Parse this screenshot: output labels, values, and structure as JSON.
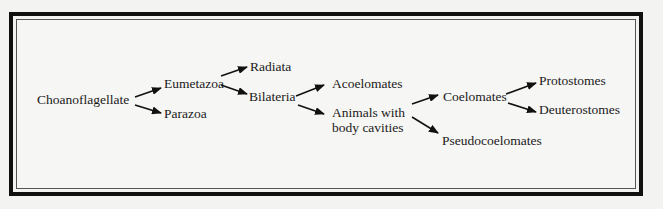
{
  "diagram": {
    "type": "phylogeny-flow",
    "nodes": {
      "choanoflagellate": "Choanoflagellate",
      "eumetazoa": "Eumetazoa",
      "parazoa": "Parazoa",
      "radiata": "Radiata",
      "bilateria": "Bilateria",
      "acoelomates": "Acoelomates",
      "animals_with_body_cavities_line1": "Animals with",
      "animals_with_body_cavities_line2": "body cavities",
      "coelomates": "Coelomates",
      "pseudocoelomates": "Pseudocoelomates",
      "protostomes": "Protostomes",
      "deuterostomes": "Deuterostomes"
    },
    "edges": [
      {
        "from": "Choanoflagellate",
        "to": "Eumetazoa"
      },
      {
        "from": "Choanoflagellate",
        "to": "Parazoa"
      },
      {
        "from": "Eumetazoa",
        "to": "Radiata"
      },
      {
        "from": "Eumetazoa",
        "to": "Bilateria"
      },
      {
        "from": "Bilateria",
        "to": "Acoelomates"
      },
      {
        "from": "Bilateria",
        "to": "Animals with body cavities"
      },
      {
        "from": "Animals with body cavities",
        "to": "Coelomates"
      },
      {
        "from": "Animals with body cavities",
        "to": "Pseudocoelomates"
      },
      {
        "from": "Coelomates",
        "to": "Protostomes"
      },
      {
        "from": "Coelomates",
        "to": "Deuterostomes"
      }
    ],
    "colors": {
      "line": "#111111",
      "frame": "#111111",
      "background": "#f3f3f1"
    }
  }
}
